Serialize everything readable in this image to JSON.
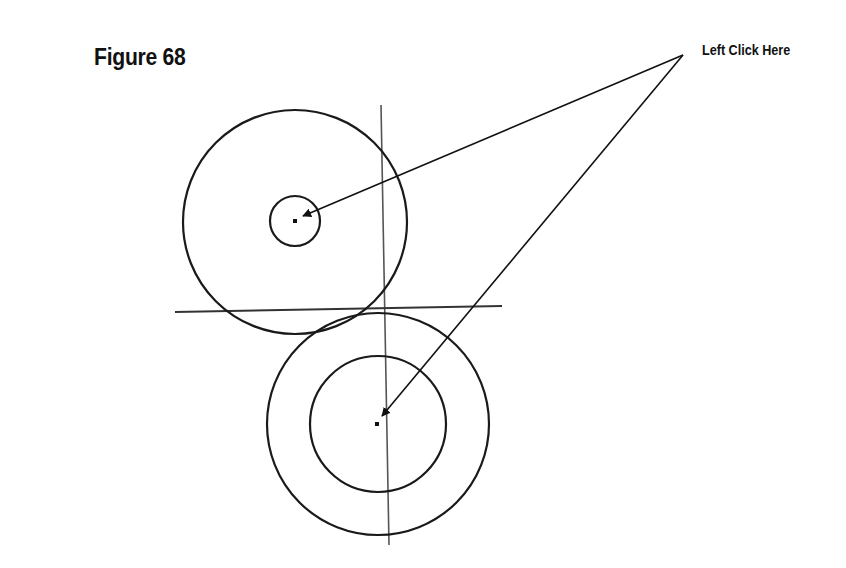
{
  "figure": {
    "title": "Figure 68",
    "callout_label": "Left Click Here"
  },
  "colors": {
    "background": "#ffffff",
    "stroke": "#1a1a1a",
    "construction_line": "#555555"
  },
  "geometry": {
    "upper_outer_circle": {
      "cx": 295,
      "cy": 222,
      "r": 112
    },
    "upper_inner_circle": {
      "cx": 295,
      "cy": 221,
      "r": 25
    },
    "upper_center_point": {
      "x": 295,
      "y": 221
    },
    "lower_outer_circle": {
      "cx": 378,
      "cy": 424,
      "r": 111
    },
    "lower_inner_circle": {
      "cx": 378,
      "cy": 424,
      "r": 68
    },
    "lower_center_point": {
      "x": 377,
      "y": 424
    },
    "horizontal_line": {
      "x1": 175,
      "y1": 312,
      "x2": 502,
      "y2": 306
    },
    "vertical_line": {
      "x1": 381,
      "y1": 105,
      "x2": 389,
      "y2": 545
    },
    "arrow_origin": {
      "x": 683,
      "y": 55
    },
    "arrow_targets": [
      {
        "x": 303,
        "y": 216
      },
      {
        "x": 382,
        "y": 416
      }
    ]
  }
}
